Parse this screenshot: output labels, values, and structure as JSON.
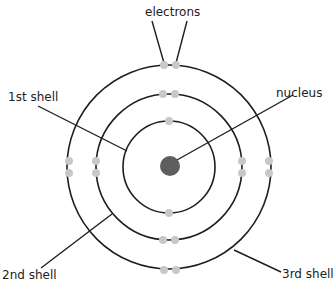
{
  "diagram": {
    "colors": {
      "shell_stroke": "#1e1e1e",
      "electron_fill": "#c8c8c8",
      "nucleus_fill": "#5e5e5e",
      "background": "#ffffff"
    },
    "center": {
      "x": 169,
      "y": 166
    },
    "shells": [
      {
        "name": "1st shell",
        "radius": 46,
        "electrons": 2
      },
      {
        "name": "2nd shell",
        "radius": 73,
        "electrons": 8
      },
      {
        "name": "3rd shell",
        "radius": 101,
        "electrons": 8
      }
    ],
    "labels": {
      "electrons": "electrons",
      "nucleus": "nucleus",
      "shell1": "1st shell",
      "shell2": "2nd shell",
      "shell3": "3rd shell"
    }
  }
}
